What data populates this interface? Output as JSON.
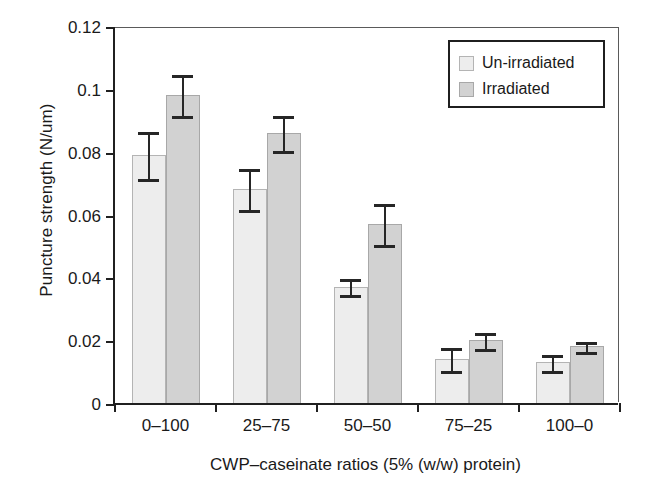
{
  "chart_data": {
    "type": "bar",
    "title": "",
    "xlabel": "CWP–caseinate ratios (5% (w/w) protein)",
    "ylabel": "Puncture strength (N/um)",
    "categories": [
      "0–100",
      "25–75",
      "50–50",
      "75–25",
      "100–0"
    ],
    "ylim": [
      0,
      0.12
    ],
    "yticks": [
      0,
      0.02,
      0.04,
      0.06,
      0.08,
      0.1,
      0.12
    ],
    "ytick_labels": [
      "0",
      "0.02",
      "0.04",
      "0.06",
      "0.08",
      "0.1",
      "0.12"
    ],
    "grid": false,
    "legend_position": "top-right",
    "series": [
      {
        "name": "Un-irradiated",
        "color": "#ededed",
        "values": [
          0.079,
          0.068,
          0.037,
          0.014,
          0.013
        ],
        "errors": [
          0.008,
          0.007,
          0.003,
          0.004,
          0.003
        ]
      },
      {
        "name": "Irradiated",
        "color": "#d2d2d2",
        "values": [
          0.098,
          0.086,
          0.057,
          0.02,
          0.018
        ],
        "errors": [
          0.007,
          0.006,
          0.007,
          0.003,
          0.002
        ]
      }
    ]
  },
  "legend": {
    "items": [
      {
        "label": "Un-irradiated",
        "swatch": "light"
      },
      {
        "label": "Irradiated",
        "swatch": "dark"
      }
    ]
  }
}
